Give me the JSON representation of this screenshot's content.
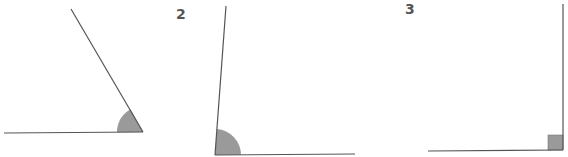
{
  "figures": [
    {
      "label": "",
      "type": "acute-angle",
      "vertex": [
        143,
        132
      ],
      "ray_a_end": [
        4,
        133
      ],
      "ray_b_end": [
        71,
        9
      ],
      "marker": "arc",
      "marker_radius": 26
    },
    {
      "label": "2",
      "type": "obtuse-angle",
      "vertex": [
        215,
        155
      ],
      "ray_a_end": [
        355,
        154
      ],
      "ray_b_end": [
        226,
        6
      ],
      "marker": "arc",
      "marker_radius": 26
    },
    {
      "label": "3",
      "type": "right-angle",
      "vertex": [
        563,
        150
      ],
      "ray_a_end": [
        428,
        151
      ],
      "ray_b_end": [
        563,
        4
      ],
      "marker": "square",
      "marker_size": 15
    }
  ],
  "colors": {
    "line": "#555555",
    "fill": "#9a9a9a",
    "label": "#555555"
  }
}
